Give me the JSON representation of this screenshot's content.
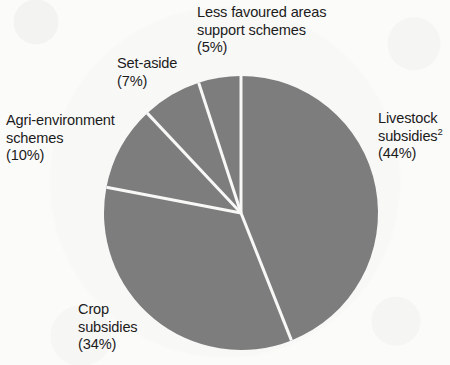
{
  "chart_data": {
    "type": "pie",
    "title": "",
    "subtitle": "",
    "xlabel": "",
    "ylabel": "",
    "legend_position": "none",
    "grid": false,
    "start_angle_deg": 0,
    "direction": "clockwise",
    "units": "percent",
    "categories": [
      "Livestock subsidies",
      "Crop subsidies",
      "Agri-environment schemes",
      "Set-aside",
      "Less favoured areas support schemes"
    ],
    "values": [
      44,
      34,
      10,
      7,
      5
    ],
    "slices": [
      {
        "id": "livestock",
        "name": "Livestock subsidies",
        "value": 44,
        "percent_text": "(44%)",
        "footnote_marker": "2",
        "label_lines": [
          "Livestock",
          "subsidies"
        ],
        "color": "#7e7e7e"
      },
      {
        "id": "crop",
        "name": "Crop subsidies",
        "value": 34,
        "percent_text": "(34%)",
        "footnote_marker": "",
        "label_lines": [
          "Crop",
          "subsidies"
        ],
        "color": "#7e7e7e"
      },
      {
        "id": "agri-environment",
        "name": "Agri-environment schemes",
        "value": 10,
        "percent_text": "(10%)",
        "footnote_marker": "",
        "label_lines": [
          "Agri-environment",
          "schemes"
        ],
        "color": "#7e7e7e"
      },
      {
        "id": "set-aside",
        "name": "Set-aside",
        "value": 7,
        "percent_text": "(7%)",
        "footnote_marker": "",
        "label_lines": [
          "Set-aside"
        ],
        "color": "#7e7e7e"
      },
      {
        "id": "less-favoured-areas",
        "name": "Less favoured areas support schemes",
        "value": 5,
        "percent_text": "(5%)",
        "footnote_marker": "",
        "label_lines": [
          "Less favoured areas",
          "support schemes"
        ],
        "color": "#7e7e7e"
      }
    ],
    "colors": {
      "slice_fill": "#7e7e7e",
      "slice_divider": "#fbfbfa",
      "background": "#fbfbfa",
      "text": "#1c1c1c"
    },
    "geometry": {
      "center_x": 241,
      "center_y": 213,
      "radius": 137,
      "divider_width": 3
    }
  },
  "labels": {
    "lfa": {
      "line1": "Less favoured areas",
      "line2": "support schemes",
      "pct": "(5%)"
    },
    "setaside": {
      "line1": "Set-aside",
      "pct": "(7%)"
    },
    "agri": {
      "line1": "Agri-environment",
      "line2": "schemes",
      "pct": "(10%)"
    },
    "livestock": {
      "line1": "Livestock",
      "line2": "subsidies",
      "sup": "2",
      "pct": "(44%)"
    },
    "crop": {
      "line1": "Crop",
      "line2": "subsidies",
      "pct": "(34%)"
    }
  }
}
